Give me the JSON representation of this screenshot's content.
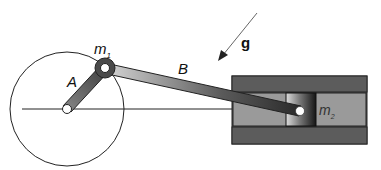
{
  "diagram": {
    "type": "slider-crank mechanism",
    "labels": {
      "crank": "A",
      "connecting_rod": "B",
      "joint_mass": "m",
      "joint_mass_sub": "1",
      "slider_mass": "m",
      "slider_mass_sub": "2",
      "gravity": "g"
    },
    "colors": {
      "line": "#222222",
      "crank_fill": "#6a6a6a",
      "rod_fill": "#8c8c8c",
      "housing_bar": "#5c5c5c",
      "channel": "#9a9a9a",
      "joint_ring": "#4a4a4a",
      "pin": "#ffffff"
    }
  }
}
